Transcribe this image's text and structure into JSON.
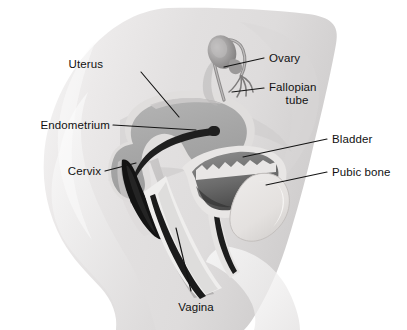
{
  "figure": {
    "background_color": "#ffffff",
    "body_fill": "#e9e9e9",
    "organ_fill": "#a9a9a9",
    "organ_wall": "#d8d8d8",
    "cavity_dark": "#3a3a3a",
    "leader_color": "#1a1a1a",
    "text_color": "#111111"
  },
  "labels": {
    "uterus": "Uterus",
    "endometrium": "Endometrium",
    "cervix": "Cervix",
    "vagina": "Vagina",
    "ovary": "Ovary",
    "fallopian_tube_line1": "Fallopian",
    "fallopian_tube_line2": "tube",
    "bladder": "Bladder",
    "pubic_bone": "Pubic bone"
  },
  "structures": [
    {
      "name": "uterus",
      "label": "Uterus",
      "side": "left"
    },
    {
      "name": "endometrium",
      "label": "Endometrium",
      "side": "left"
    },
    {
      "name": "cervix",
      "label": "Cervix",
      "side": "left"
    },
    {
      "name": "vagina",
      "label": "Vagina",
      "side": "bottom"
    },
    {
      "name": "ovary",
      "label": "Ovary",
      "side": "right"
    },
    {
      "name": "fallopian-tube",
      "label": "Fallopian tube",
      "side": "right"
    },
    {
      "name": "bladder",
      "label": "Bladder",
      "side": "right"
    },
    {
      "name": "pubic-bone",
      "label": "Pubic bone",
      "side": "right"
    }
  ]
}
